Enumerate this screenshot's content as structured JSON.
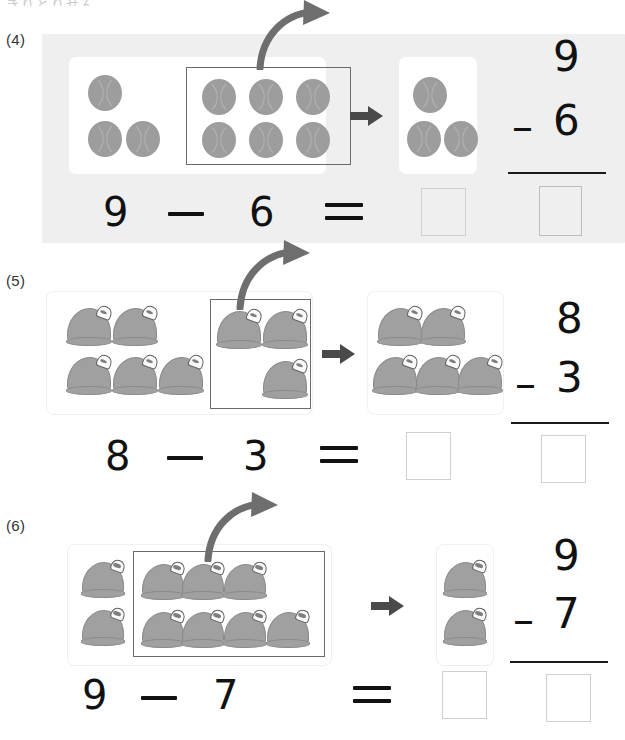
{
  "page": {
    "top_cut_text": "きりとりせん",
    "background_color": "#ffffff"
  },
  "colors": {
    "object_gray": "#a0a0a0",
    "ball_gray": "#9d9d9d",
    "panel_shade": "#efefef",
    "arrow_gray": "#6e6e6e",
    "selection_border": "#6a6a6a",
    "answer_box_border": "#cfcfcf",
    "digit_color": "#111111"
  },
  "problems": [
    {
      "number": "(4)",
      "object": "ball",
      "total": 9,
      "subtrahend": 6,
      "remaining": 3,
      "shaded_background": true,
      "equation": {
        "minuend": "9",
        "minus": "–",
        "subtrahend": "6",
        "equals": "=",
        "answer": ""
      },
      "vertical": {
        "minuend": "9",
        "operator": "–",
        "subtrahend": "6",
        "answer": ""
      },
      "start_card": {
        "outside_count": 3,
        "inside_count": 6,
        "inside_rows": [
          3,
          3
        ]
      },
      "result_card": {
        "count": 3
      }
    },
    {
      "number": "(5)",
      "object": "hat",
      "total": 8,
      "subtrahend": 3,
      "remaining": 5,
      "shaded_background": false,
      "equation": {
        "minuend": "8",
        "minus": "–",
        "subtrahend": "3",
        "equals": "=",
        "answer": ""
      },
      "vertical": {
        "minuend": "8",
        "operator": "–",
        "subtrahend": "3",
        "answer": ""
      },
      "start_card": {
        "outside_count": 5,
        "inside_count": 3,
        "inside_rows": [
          2,
          1
        ]
      },
      "result_card": {
        "count": 5
      }
    },
    {
      "number": "(6)",
      "object": "hat",
      "total": 9,
      "subtrahend": 7,
      "remaining": 2,
      "shaded_background": false,
      "equation": {
        "minuend": "9",
        "minus": "–",
        "subtrahend": "7",
        "equals": "=",
        "answer": ""
      },
      "vertical": {
        "minuend": "9",
        "operator": "–",
        "subtrahend": "7",
        "answer": ""
      },
      "start_card": {
        "outside_count": 2,
        "inside_count": 7,
        "inside_rows": [
          3,
          4
        ]
      },
      "result_card": {
        "count": 2
      }
    }
  ]
}
